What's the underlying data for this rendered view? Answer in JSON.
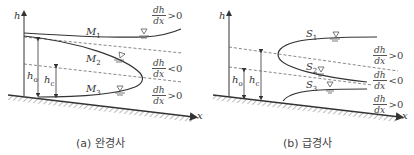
{
  "panels": [
    {
      "id": "a",
      "caption": "(a) 완경사",
      "axis_labels": {
        "y": "h",
        "x": "x"
      },
      "curves": [
        {
          "name": "M",
          "sub": "1"
        },
        {
          "name": "M",
          "sub": "2"
        },
        {
          "name": "M",
          "sub": "3"
        }
      ],
      "depths": [
        {
          "name": "h",
          "sub": "o"
        },
        {
          "name": "h",
          "sub": "c"
        }
      ],
      "gradients": [
        {
          "num": "dh",
          "den": "dx",
          "rel": ">0"
        },
        {
          "num": "dh",
          "den": "dx",
          "rel": "<0"
        },
        {
          "num": "dh",
          "den": "dx",
          "rel": ">0"
        }
      ]
    },
    {
      "id": "b",
      "caption": "(b) 급경사",
      "axis_labels": {
        "y": "h",
        "x": "x"
      },
      "curves": [
        {
          "name": "S",
          "sub": "1"
        },
        {
          "name": "S",
          "sub": "2"
        },
        {
          "name": "S",
          "sub": "3"
        }
      ],
      "depths": [
        {
          "name": "h",
          "sub": "o"
        },
        {
          "name": "h",
          "sub": "c"
        }
      ],
      "gradients": [
        {
          "num": "dh",
          "den": "dx",
          "rel": ">0"
        },
        {
          "num": "dh",
          "den": "dx",
          "rel": "<0"
        },
        {
          "num": "dh",
          "den": "dx",
          "rel": ">0"
        }
      ]
    }
  ],
  "colors": {
    "line": "#333333",
    "dashed": "#555555",
    "hatch": "#666666"
  }
}
